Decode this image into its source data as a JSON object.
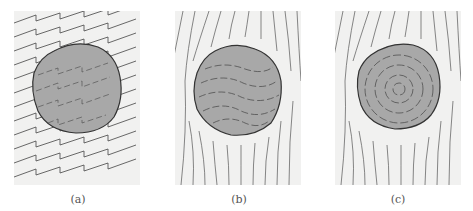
{
  "figure": {
    "panels": [
      {
        "id": "a",
        "label": "(a)",
        "description": "grain with straight stepped inclusion trails continuous with external foliation"
      },
      {
        "id": "b",
        "label": "(b)",
        "description": "grain with curved inclusion trails, deflected external foliation"
      },
      {
        "id": "c",
        "label": "(c)",
        "description": "grain with concentric inclusion rings, deflected external foliation"
      }
    ],
    "colors": {
      "background": "#f1f1f0",
      "grain_fill": "#a8a8a8",
      "line": "#3a3a3a"
    }
  }
}
